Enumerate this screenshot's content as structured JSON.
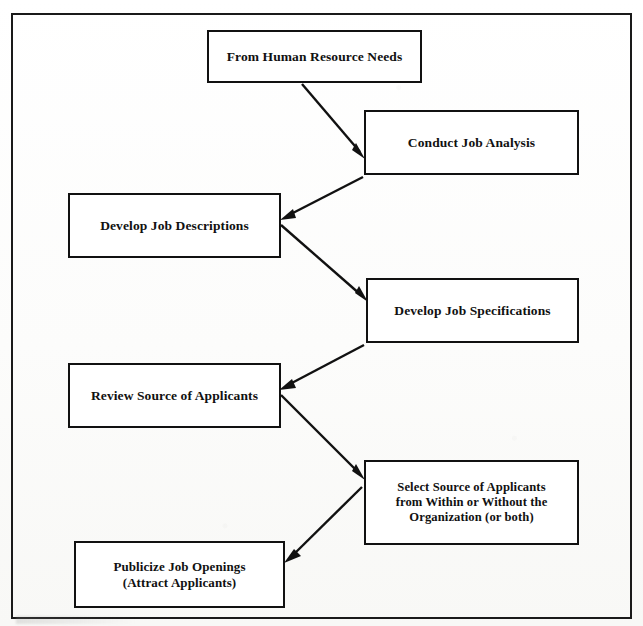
{
  "diagram": {
    "type": "flowchart",
    "orientation": "zigzag-vertical",
    "frame_label": "outer-border",
    "colors": {
      "page_background": "#ffffff",
      "box_border": "#111111",
      "box_fill": "#ffffff",
      "text": "#111111",
      "arrow": "#111111",
      "frame_border": "#1a1a1a"
    },
    "nodes": [
      {
        "id": "from-human-resource-needs",
        "label": "From Human Resource Needs",
        "side": "center",
        "order": 1
      },
      {
        "id": "conduct-job-analysis",
        "label": "Conduct Job Analysis",
        "side": "right",
        "order": 2
      },
      {
        "id": "develop-job-descriptions",
        "label": "Develop Job Descriptions",
        "side": "left",
        "order": 3
      },
      {
        "id": "develop-job-specifications",
        "label": "Develop Job Specifications",
        "side": "right",
        "order": 4
      },
      {
        "id": "review-source-applicants",
        "label": "Review Source of Applicants",
        "side": "left",
        "order": 5
      },
      {
        "id": "select-source-applicants",
        "label": "Select Source of Applicants\nfrom Within or Without the\nOrganization (or both)",
        "side": "right",
        "order": 6
      },
      {
        "id": "publicize-job-openings",
        "label": "Publicize Job Openings\n(Attract Applicants)",
        "side": "left",
        "order": 7
      }
    ],
    "edges": [
      {
        "id": "edge-1",
        "from": "from-human-resource-needs",
        "to": "conduct-job-analysis",
        "direction": "down-right"
      },
      {
        "id": "edge-2",
        "from": "conduct-job-analysis",
        "to": "develop-job-descriptions",
        "direction": "down-left"
      },
      {
        "id": "edge-3",
        "from": "develop-job-descriptions",
        "to": "develop-job-specifications",
        "direction": "down-right"
      },
      {
        "id": "edge-4",
        "from": "develop-job-specifications",
        "to": "review-source-applicants",
        "direction": "down-left"
      },
      {
        "id": "edge-5",
        "from": "review-source-applicants",
        "to": "select-source-applicants",
        "direction": "down-right"
      },
      {
        "id": "edge-6",
        "from": "select-source-applicants",
        "to": "publicize-job-openings",
        "direction": "down-left"
      }
    ]
  }
}
